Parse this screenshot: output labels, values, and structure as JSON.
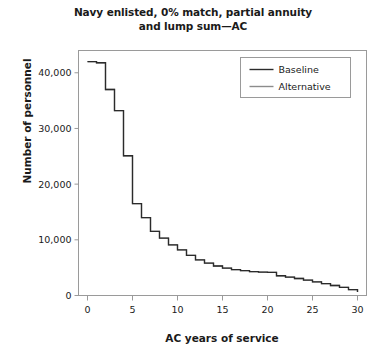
{
  "chart_data": {
    "type": "line",
    "title": "Navy enlisted, 0% match, partial annuity and lump sum—AC",
    "title_line1": "Navy enlisted, 0% match, partial annuity",
    "title_line2": "and lump sum—AC",
    "xlabel": "AC years of service",
    "ylabel": "Number of personnel",
    "xlim": [
      -1,
      31
    ],
    "ylim": [
      0,
      44000
    ],
    "xticks": [
      0,
      5,
      10,
      15,
      20,
      25,
      30
    ],
    "xticklabels": [
      "0",
      "5",
      "10",
      "15",
      "20",
      "25",
      "30"
    ],
    "yticks": [
      0,
      10000,
      20000,
      30000,
      40000
    ],
    "yticklabels": [
      "0",
      "10,000",
      "20,000",
      "30,000",
      "40,000"
    ],
    "grid": false,
    "drawstyle": "steps-post",
    "legend_position": "upper right",
    "legend_entries": [
      "Baseline",
      "Alternative"
    ],
    "x": [
      0,
      1,
      2,
      3,
      4,
      5,
      6,
      7,
      8,
      9,
      10,
      11,
      12,
      13,
      14,
      15,
      16,
      17,
      18,
      19,
      20,
      21,
      22,
      23,
      24,
      25,
      26,
      27,
      28,
      29,
      30
    ],
    "series": [
      {
        "name": "Baseline",
        "color": "#2b2b2b",
        "values": [
          42000,
          41800,
          37000,
          33200,
          25100,
          16500,
          14000,
          11500,
          10300,
          9100,
          8200,
          7200,
          6400,
          5800,
          5300,
          4900,
          4650,
          4450,
          4300,
          4200,
          4150,
          3550,
          3300,
          3050,
          2750,
          2450,
          2150,
          1800,
          1450,
          1050,
          620
        ]
      },
      {
        "name": "Alternative",
        "color": "#8c8c8c",
        "values": [
          42000,
          41800,
          37000,
          33200,
          25100,
          16500,
          14000,
          11500,
          10300,
          9100,
          8200,
          7200,
          6400,
          5800,
          5300,
          4900,
          4650,
          4450,
          4300,
          4200,
          4150,
          3550,
          3300,
          3050,
          2750,
          2450,
          2150,
          1800,
          1450,
          1050,
          620
        ]
      }
    ]
  }
}
